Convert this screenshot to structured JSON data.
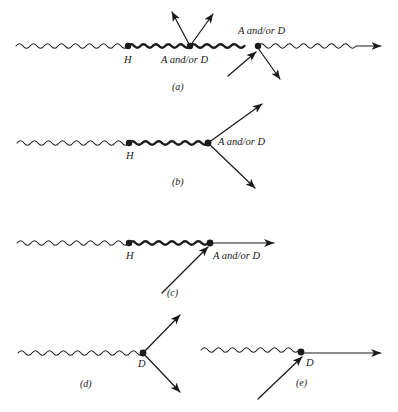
{
  "figure": {
    "background_color": "#ffffff",
    "ink_color": "#1a1a1a"
  },
  "labels": {
    "a_and_or_d": "A and/or D",
    "h": "H",
    "d": "D"
  },
  "panels": [
    {
      "id": "a",
      "caption": "(a)",
      "vertex_labels": [
        "H",
        "A and/or D",
        "A and/or D"
      ]
    },
    {
      "id": "b",
      "caption": "(b)",
      "vertex_labels": [
        "H",
        "A and/or D"
      ]
    },
    {
      "id": "c",
      "caption": "(c)",
      "vertex_labels": [
        "H",
        "A and/or D"
      ]
    },
    {
      "id": "d",
      "caption": "(d)",
      "vertex_labels": [
        "D"
      ]
    },
    {
      "id": "e",
      "caption": "(e)",
      "vertex_labels": [
        "D"
      ]
    }
  ],
  "panel_a": {
    "caption": "(a)",
    "label_h": "H",
    "label_mid": "A and/or D",
    "label_right": "A and/or D"
  },
  "panel_b": {
    "caption": "(b)",
    "label_h": "H",
    "label_vertex": "A and/or D"
  },
  "panel_c": {
    "caption": "(c)",
    "label_h": "H",
    "label_vertex": "A and/or D"
  },
  "panel_d": {
    "caption": "(d)",
    "label_vertex": "D"
  },
  "panel_e": {
    "caption": "(e)",
    "label_vertex": "D"
  }
}
